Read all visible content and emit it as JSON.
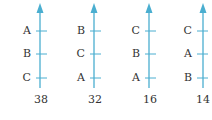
{
  "colors": {
    "axis": "#4aaed0",
    "text": "#333333"
  },
  "ballots": [
    {
      "ranking_top_to_bottom": [
        "A",
        "B",
        "C"
      ],
      "count": "38"
    },
    {
      "ranking_top_to_bottom": [
        "B",
        "C",
        "A"
      ],
      "count": "32"
    },
    {
      "ranking_top_to_bottom": [
        "C",
        "B",
        "A"
      ],
      "count": "16"
    },
    {
      "ranking_top_to_bottom": [
        "C",
        "A",
        "B"
      ],
      "count": "14"
    }
  ]
}
